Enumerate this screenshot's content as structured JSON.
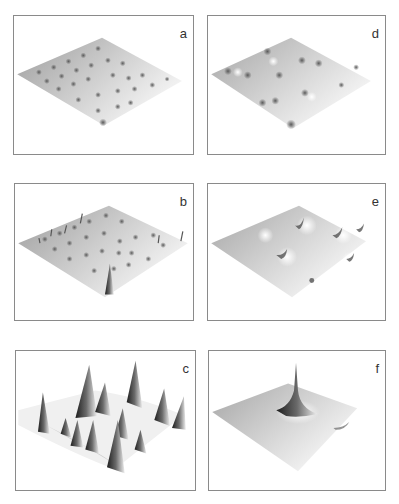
{
  "figure": {
    "panels": [
      {
        "id": "a",
        "label": "a",
        "description": "flat surface with many small dimples"
      },
      {
        "id": "b",
        "label": "b",
        "description": "surface with many small spikes, one tall spike front"
      },
      {
        "id": "c",
        "label": "c",
        "description": "surface with many tall sharp peaks"
      },
      {
        "id": "d",
        "label": "d",
        "description": "flat surface with fewer shallow dimples"
      },
      {
        "id": "e",
        "label": "e",
        "description": "surface with several small peaks"
      },
      {
        "id": "f",
        "label": "f",
        "description": "surface with single tall peak"
      }
    ],
    "colors": {
      "frame": "#8a8a8a",
      "surface_dark": "#9a9a9a",
      "surface_light": "#f2f2f2",
      "peak_shadow": "#2a2a2a"
    }
  }
}
